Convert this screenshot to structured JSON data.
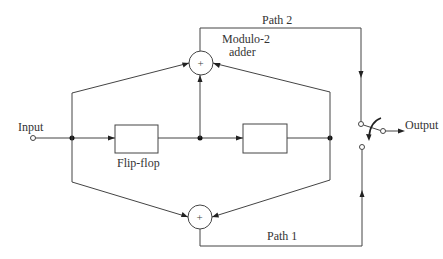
{
  "diagram": {
    "labels": {
      "input": "Input",
      "output": "Output",
      "flip_flop": "Flip-flop",
      "adder_line1": "Modulo-2",
      "adder_line2": "adder",
      "path1": "Path 1",
      "path2": "Path 2",
      "plus": "+"
    },
    "nodes": [
      {
        "id": "input",
        "type": "terminal"
      },
      {
        "id": "ff1",
        "type": "flip-flop"
      },
      {
        "id": "ff2",
        "type": "flip-flop"
      },
      {
        "id": "adder_top",
        "type": "modulo-2 adder"
      },
      {
        "id": "adder_bottom",
        "type": "modulo-2 adder"
      },
      {
        "id": "switch",
        "type": "commutator switch"
      },
      {
        "id": "output",
        "type": "terminal"
      }
    ],
    "edges": [
      {
        "from": "input",
        "to": "ff1"
      },
      {
        "from": "ff1",
        "to": "ff2"
      },
      {
        "from": "input",
        "to": "adder_top"
      },
      {
        "from": "input",
        "to": "adder_bottom"
      },
      {
        "from": "ff1",
        "to": "adder_top"
      },
      {
        "from": "ff2",
        "to": "adder_top"
      },
      {
        "from": "ff2",
        "to": "adder_bottom"
      },
      {
        "from": "adder_top",
        "to": "switch",
        "label": "Path 2"
      },
      {
        "from": "adder_bottom",
        "to": "switch",
        "label": "Path 1"
      },
      {
        "from": "switch",
        "to": "output"
      }
    ]
  }
}
